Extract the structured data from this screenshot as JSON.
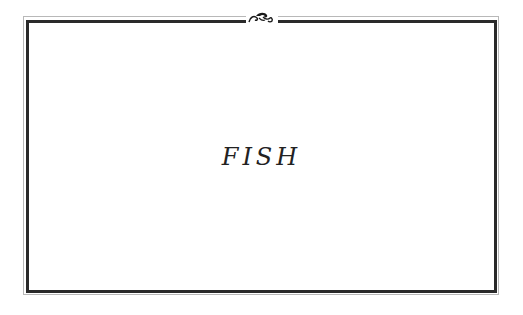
{
  "page": {
    "title": "FISH"
  },
  "frame": {
    "ornament_icon": "scroll-flourish-icon",
    "border_color": "#2a2a2a",
    "outer_line_color": "#b8b8b8"
  }
}
